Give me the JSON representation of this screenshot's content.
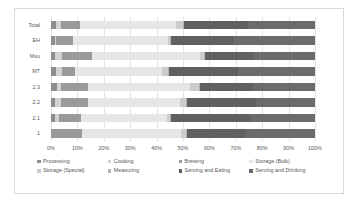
{
  "chart_data": {
    "type": "bar",
    "orientation": "horizontal",
    "stacked": true,
    "normalized": true,
    "title": "",
    "subtitle": "",
    "xlabel": "",
    "ylabel": "",
    "xlim": [
      0,
      100
    ],
    "grid": true,
    "legend_position": "bottom",
    "xticks": [
      "0%",
      "10%",
      "20%",
      "30%",
      "40%",
      "50%",
      "60%",
      "70%",
      "80%",
      "90%",
      "100%"
    ],
    "xtick_values": [
      0,
      10,
      20,
      30,
      40,
      50,
      60,
      70,
      80,
      90,
      100
    ],
    "categories": [
      "Total",
      "EH",
      "Msu",
      "MT",
      "2.3",
      "2.2",
      "2.1",
      "1"
    ],
    "series": [
      {
        "name": "Processing",
        "color": "#8d8d8d",
        "values": [
          1.8,
          1.4,
          1.5,
          1.8,
          2.2,
          1.6,
          1.4,
          0.0
        ]
      },
      {
        "name": "Cooking",
        "color": "#d2d2d2",
        "values": [
          2.0,
          0.5,
          2.5,
          2.2,
          1.6,
          2.1,
          1.7,
          0.0
        ]
      },
      {
        "name": "Brewing",
        "color": "#9a9a9a",
        "values": [
          7.2,
          6.5,
          11.5,
          5.2,
          10.4,
          10.5,
          8.2,
          11.6
        ]
      },
      {
        "name": "Storage (Bulk)",
        "color": "#e6e6e6",
        "values": [
          36.5,
          35.8,
          40.8,
          33.0,
          38.5,
          34.5,
          32.5,
          37.5
        ]
      },
      {
        "name": "Storage (Special)",
        "color": "#cccccc",
        "values": [
          2.4,
          0.9,
          1.6,
          2.1,
          3.2,
          2.4,
          1.3,
          2.1
        ]
      },
      {
        "name": "Measuring",
        "color": "#b5b5b5",
        "values": [
          0.6,
          0.4,
          0.6,
          0.4,
          0.6,
          0.5,
          0.4,
          0.3
        ]
      },
      {
        "name": "Serving and Eating",
        "color": "#606060",
        "values": [
          24.0,
          24.0,
          18.0,
          26.0,
          20.0,
          26.0,
          30.0,
          22.0
        ]
      },
      {
        "name": "Serving and Drinking",
        "color": "#6b6b6b",
        "values": [
          25.5,
          30.5,
          23.5,
          29.3,
          23.5,
          22.4,
          24.5,
          26.5
        ]
      }
    ]
  },
  "legend": {
    "rows": [
      [
        "Processing",
        "Cooking",
        "Brewing",
        "Storage (Bulk)"
      ],
      [
        "Storage (Special)",
        "Measuring",
        "Serving and Eating",
        "Serving and Drinking"
      ]
    ]
  }
}
